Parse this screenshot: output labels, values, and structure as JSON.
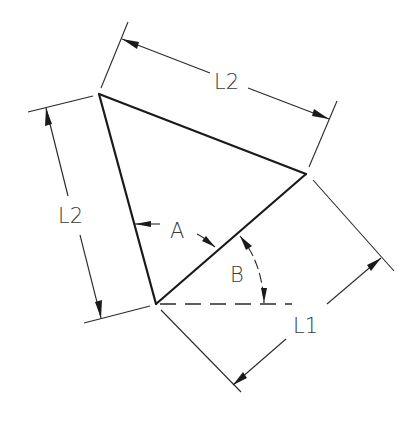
{
  "diagram": {
    "type": "engineering dimension drawing",
    "shape": "triangle",
    "vertices": {
      "top": [
        99,
        94
      ],
      "right": [
        306,
        174
      ],
      "bottom": [
        156,
        304
      ]
    },
    "labels": {
      "top_dimension": "L2",
      "left_dimension": "L2",
      "lower_right_dimension": "L1",
      "angle_a": "A",
      "angle_b": "B"
    },
    "colors": {
      "line": "#1a1a1a",
      "text": "#3a3a3a",
      "background": "#ffffff"
    }
  }
}
